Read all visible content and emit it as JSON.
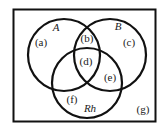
{
  "diagram": {
    "type": "venn",
    "sets": [
      {
        "name": "A",
        "label": "A"
      },
      {
        "name": "B",
        "label": "B"
      },
      {
        "name": "Rh",
        "label": "Rh"
      }
    ],
    "regions": [
      {
        "id": "a",
        "label": "(a)"
      },
      {
        "id": "b",
        "label": "(b)"
      },
      {
        "id": "c",
        "label": "(c)"
      },
      {
        "id": "d",
        "label": "(d)"
      },
      {
        "id": "e",
        "label": "(e)"
      },
      {
        "id": "f",
        "label": "(f)"
      },
      {
        "id": "g",
        "label": "(g)"
      }
    ],
    "colors": {
      "stroke": "#111111",
      "background": "#ffffff"
    }
  }
}
